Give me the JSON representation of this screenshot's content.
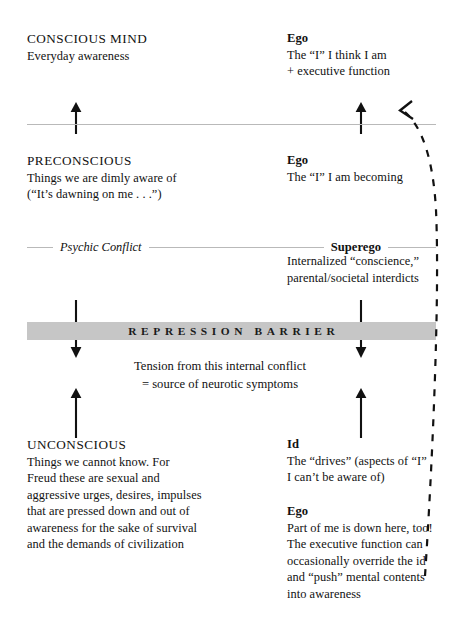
{
  "diagram": {
    "colors": {
      "text": "#111111",
      "barrier_fill": "#c6c6c6",
      "rule_grey": "#b9b9b9",
      "arrow_black": "#111111"
    },
    "levels": [
      {
        "id": "conscious",
        "heading": "CONSCIOUS MIND",
        "lines": [
          "Everyday awareness"
        ]
      },
      {
        "id": "preconscious",
        "heading": "PRECONSCIOUS",
        "lines": [
          "Things we are dimly aware of",
          "(“It’s dawning on me . . .”)"
        ]
      },
      {
        "id": "unconscious",
        "heading": "UNCONSCIOUS",
        "lines": [
          "Things we cannot know. For",
          "Freud these are sexual and",
          "aggressive urges, desires, impulses",
          "that are pressed down and out of",
          "awareness for the sake of survival",
          "and the demands of civilization"
        ]
      }
    ],
    "structures": [
      {
        "id": "ego-conscious",
        "heading": "Ego",
        "lines": [
          "The “I” I think I am",
          "+ executive function"
        ]
      },
      {
        "id": "ego-preconscious",
        "heading": "Ego",
        "lines": [
          "The “I” I am becoming"
        ]
      },
      {
        "id": "superego",
        "heading": "Superego",
        "lines": [
          "Internalized “conscience,”",
          "parental/societal interdicts"
        ]
      },
      {
        "id": "id",
        "heading": "Id",
        "lines": [
          "The “drives” (aspects of “I”",
          "I can’t be aware of)"
        ]
      },
      {
        "id": "ego-unconscious",
        "heading": "Ego",
        "lines": [
          "Part of me is down here, too!",
          "The executive function can",
          "occasionally override the id",
          "and “push” mental contents",
          "into awareness"
        ]
      }
    ],
    "rules": {
      "psychic_conflict_label": "Psychic Conflict",
      "superego_label": "Superego"
    },
    "barrier": {
      "label": "REPRESSION BARRIER"
    },
    "tension_note": {
      "line1": "Tension from this internal conflict",
      "line2": "= source of neurotic symptoms"
    },
    "arrows": {
      "up_left_top": "upward-arrow",
      "up_right_top": "upward-arrow",
      "down_left_barrier": "downward-arrow",
      "down_right_barrier": "downward-arrow",
      "up_left_bottom": "upward-arrow",
      "up_right_bottom": "upward-arrow",
      "feedback_curve": "dashed-curved-arrow"
    }
  }
}
